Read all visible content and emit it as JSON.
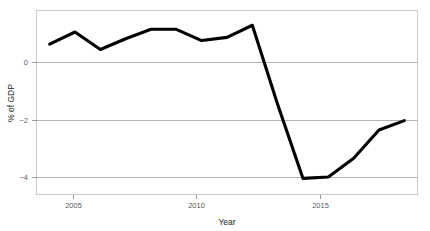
{
  "chart_data": {
    "type": "line",
    "title": "",
    "xlabel": "Year",
    "ylabel": "% of GDP",
    "x": [
      2004,
      2005,
      2006,
      2007,
      2008,
      2009,
      2010,
      2011,
      2012,
      2013,
      2014,
      2015,
      2016,
      2017,
      2018
    ],
    "values": [
      0.65,
      1.1,
      0.45,
      0.85,
      1.2,
      1.2,
      0.78,
      0.9,
      1.35,
      -1.6,
      -4.35,
      -4.3,
      -3.6,
      -2.55,
      -2.2
    ],
    "series": [
      {
        "name": "% of GDP",
        "values": [
          0.65,
          1.1,
          0.45,
          0.85,
          1.2,
          1.2,
          0.78,
          0.9,
          1.35,
          -1.6,
          -4.35,
          -4.3,
          -3.6,
          -2.55,
          -2.2
        ]
      }
    ],
    "xlim": [
      2003.5,
      2018.5
    ],
    "ylim": [
      -4.95,
      1.9
    ],
    "xticks": [
      2005,
      2010,
      2015
    ],
    "xtick_labels": [
      "2005",
      "2010",
      "2015"
    ],
    "yticks": [
      0,
      -2,
      -4
    ],
    "ytick_labels": [
      "0",
      "−2",
      "−4"
    ],
    "grid": "horizontal",
    "legend": "none",
    "line_color": "#000000",
    "grid_color": "#b3b3b3",
    "frame_color": "#c9c9c9",
    "background": "#ffffff"
  },
  "axes": {
    "x_title": "Year",
    "y_title": "% of GDP"
  },
  "ticks": {
    "x": [
      {
        "label": "2005",
        "value": 2005
      },
      {
        "label": "2010",
        "value": 2010
      },
      {
        "label": "2015",
        "value": 2015
      }
    ],
    "y": [
      {
        "label": "0",
        "value": 0
      },
      {
        "label": "−2",
        "value": -2
      },
      {
        "label": "−4",
        "value": -4
      }
    ]
  }
}
